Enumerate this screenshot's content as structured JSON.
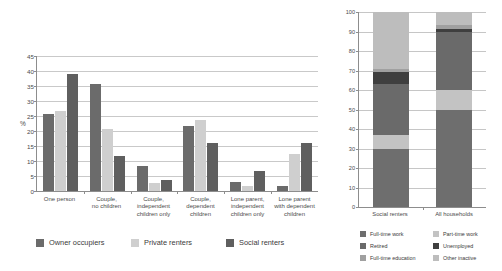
{
  "palette": {
    "owner_occupiers": "#6b6b6b",
    "private_renters": "#cfcfcf",
    "social_renters": "#5f5f5f",
    "full_time_work": "#6e6e6e",
    "part_time_work": "#c3c3c3",
    "retired": "#6a6a6a",
    "unemployed": "#3f3f3f",
    "full_time_education": "#a0a0a0",
    "other_inactive": "#bdbdbd",
    "axis": "#8d8d8d",
    "gridline": "#c9c9c9"
  },
  "left_chart": {
    "ylabel": "%",
    "legend": [
      {
        "label": "Owner occupiers",
        "color": "#6b6b6b"
      },
      {
        "label": "Private renters",
        "color": "#cfcfcf"
      },
      {
        "label": "Social renters",
        "color": "#5f5f5f"
      }
    ],
    "yticks": [
      "45",
      "40",
      "35",
      "30",
      "25",
      "20",
      "15",
      "10",
      "5",
      "0"
    ]
  },
  "right_chart": {
    "yticks": [
      "100",
      "90",
      "80",
      "70",
      "60",
      "50",
      "40",
      "30",
      "20",
      "10",
      "0"
    ],
    "legend": [
      {
        "label": "Full-time work",
        "color": "#6e6e6e"
      },
      {
        "label": "Part-time work",
        "color": "#c3c3c3"
      },
      {
        "label": "Retired",
        "color": "#6a6a6a"
      },
      {
        "label": "Unemployed",
        "color": "#3f3f3f"
      },
      {
        "label": "Full-time education",
        "color": "#a0a0a0"
      },
      {
        "label": "Other inactive",
        "color": "#bdbdbd"
      }
    ]
  },
  "footer": {
    "note": ""
  },
  "chart_data": [
    {
      "type": "bar",
      "title": "",
      "subtitle": "",
      "xlabel": "",
      "ylabel": "%",
      "ylim": [
        0,
        45
      ],
      "ytick_step": 5,
      "grid": true,
      "legend_position": "bottom",
      "categories": [
        "One person",
        "Couple, no children",
        "Couple, independent children only",
        "Couple, dependent children",
        "Lone parent, independent children only",
        "Lone parent with dependent children"
      ],
      "category_lines": [
        [
          "One person"
        ],
        [
          "Couple,",
          "no children"
        ],
        [
          "Couple,",
          "independent",
          "children only"
        ],
        [
          "Couple,",
          "dependent",
          "children"
        ],
        [
          "Lone parent,",
          "independent",
          "children only"
        ],
        [
          "Lone parent",
          "with dependent",
          "children"
        ]
      ],
      "series": [
        {
          "name": "Owner occupiers",
          "color": "#6b6b6b",
          "values": [
            25.8,
            35.8,
            8.4,
            21.7,
            3.0,
            1.8
          ]
        },
        {
          "name": "Private renters",
          "color": "#cfcfcf",
          "values": [
            26.6,
            20.6,
            2.6,
            23.6,
            1.6,
            12.5
          ]
        },
        {
          "name": "Social renters",
          "color": "#5f5f5f",
          "values": [
            38.9,
            11.8,
            3.7,
            16.0,
            6.6,
            16.0
          ]
        }
      ]
    },
    {
      "type": "bar",
      "stacked": true,
      "title": "",
      "xlabel": "",
      "ylabel": "",
      "ylim": [
        0,
        100
      ],
      "ytick_step": 10,
      "grid": true,
      "legend_position": "bottom",
      "categories": [
        "Social renters",
        "All households"
      ],
      "series": [
        {
          "name": "Full-time work",
          "color": "#6e6e6e",
          "values": [
            30,
            50
          ]
        },
        {
          "name": "Part-time work",
          "color": "#c3c3c3",
          "values": [
            7,
            10
          ]
        },
        {
          "name": "Retired",
          "color": "#6a6a6a",
          "values": [
            26,
            30
          ]
        },
        {
          "name": "Unemployed",
          "color": "#3f3f3f",
          "values": [
            6,
            1.5
          ]
        },
        {
          "name": "Full-time education",
          "color": "#a0a0a0",
          "values": [
            2,
            2
          ]
        },
        {
          "name": "Other inactive",
          "color": "#bdbdbd",
          "values": [
            29,
            6.5
          ]
        }
      ]
    }
  ]
}
